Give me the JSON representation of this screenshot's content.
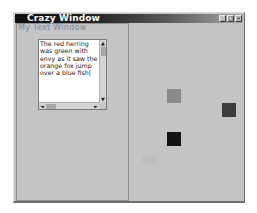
{
  "window": {
    "title": "Crazy Window",
    "buttons": [
      {
        "name": "minimize",
        "glyph": "_"
      },
      {
        "name": "maximize",
        "glyph": "□"
      },
      {
        "name": "close",
        "glyph": "×"
      }
    ]
  },
  "text_panel": {
    "label": "My Text Window",
    "textbox": {
      "value": "The red herring was green with envy as it saw the orange fox jump over a blue fish|"
    },
    "scrollbar": {
      "up_arrow": "▲",
      "down_arrow": "▼",
      "left_arrow": "◄",
      "right_arrow": "►"
    }
  },
  "canvas": {
    "squares": [
      {
        "name": "gray-square",
        "x": 37,
        "y": 66,
        "color": "#8a8a8a"
      },
      {
        "name": "dark-gray-square",
        "x": 92,
        "y": 80,
        "color": "#3c3c3c"
      },
      {
        "name": "black-square",
        "x": 37,
        "y": 109,
        "color": "#121212"
      }
    ],
    "blob": {
      "x": 12,
      "y": 132,
      "color": "#bcbcbc"
    }
  }
}
